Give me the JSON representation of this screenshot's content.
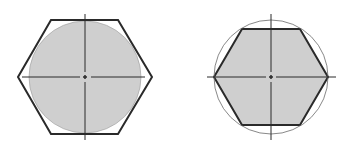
{
  "figures": [
    {
      "id": "circle-inscribed-in-hexagon",
      "description": "Gray filled circle inscribed in hexagon outline",
      "center": [
        85,
        77
      ],
      "circle_radius": 56,
      "hexagon_points": "18,77 51,20 118,20 152,77 118,134 51,134"
    },
    {
      "id": "hexagon-inscribed-in-circle",
      "description": "Gray filled hexagon inscribed in thin circle",
      "center": [
        271,
        77
      ],
      "circle_radius": 57,
      "hexagon_points": "214,77 242,29 300,29 328,77 300,125 242,125"
    }
  ],
  "colors": {
    "fill": "#cfcfcf",
    "stroke": "#2a2a2a",
    "thin_stroke": "#6a6a6a",
    "background": "#ffffff"
  }
}
